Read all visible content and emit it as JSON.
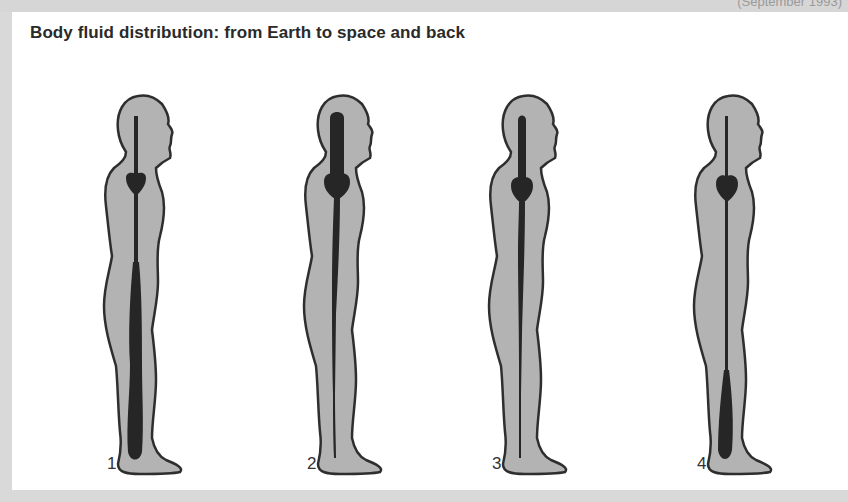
{
  "header": {
    "top_note": "(September 1993)"
  },
  "diagram": {
    "title": "Body fluid distribution: from Earth to space and back",
    "colors": {
      "background_frame": "#d9d9d9",
      "panel": "#ffffff",
      "body_fill": "#b3b3b3",
      "body_outline": "#2e2e2e",
      "fluid": "#262626",
      "title_text": "#2a2a2a"
    },
    "figures": [
      {
        "label": "1",
        "description": "On Earth: fluid pooled in legs, thin column in head"
      },
      {
        "label": "2",
        "description": "Early in space: fluid shifted to head and chest"
      },
      {
        "label": "3",
        "description": "Adapted to space: reduced fluid overall, thinner legs column"
      },
      {
        "label": "4",
        "description": "Back on Earth: fluid drains to lower legs, thin column above"
      }
    ]
  }
}
